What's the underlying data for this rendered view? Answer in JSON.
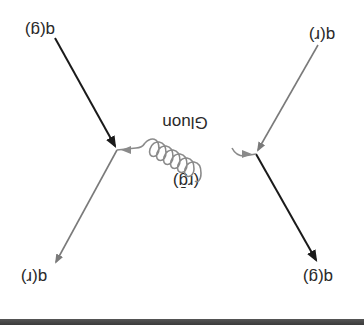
{
  "diagram": {
    "rotation_deg": 180,
    "labels": {
      "top_left": "q(g)",
      "top_right": "q(r)",
      "bottom_left": "q(r)",
      "bottom_right": "q(g)",
      "gluon_name": "Gluon",
      "gluon_color": "(rḡ)"
    },
    "colors": {
      "dark_line": "#1a1a1a",
      "gray_line": "#7a7a7a",
      "gluon": "#8a8a8a",
      "text": "#2a2a2a",
      "bottom_bar": "#444444"
    }
  }
}
